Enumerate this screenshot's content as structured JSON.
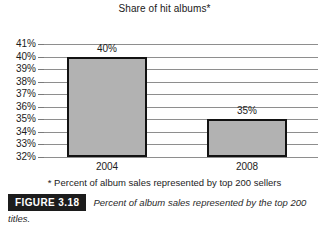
{
  "chart_data": {
    "type": "bar",
    "title": "Share of hit albums*",
    "xlabel": "",
    "ylabel": "",
    "categories": [
      "2004",
      "2008"
    ],
    "values": [
      40,
      35
    ],
    "data_labels": [
      "40%",
      "35%"
    ],
    "ylim": [
      32,
      41
    ],
    "ytick_values": [
      41,
      40,
      39,
      38,
      37,
      36,
      35,
      34,
      33,
      32
    ],
    "ytick_labels": [
      "41%",
      "40%",
      "39%",
      "38%",
      "37%",
      "36%",
      "35%",
      "34%",
      "33%",
      "32%"
    ],
    "grid": true,
    "legend": "none",
    "annotations": [
      "* Percent of album sales represented by top 200 sellers"
    ],
    "bar_fill_color": "#b2b2b2",
    "bar_edge_color": "#121212",
    "gridline_color": "#8e8e8e"
  },
  "footnote": "* Percent of album sales represented by top 200 sellers",
  "caption": {
    "figure_tag": "FIGURE 3.18",
    "text": "Percent of album sales represented by the top 200 titles."
  }
}
